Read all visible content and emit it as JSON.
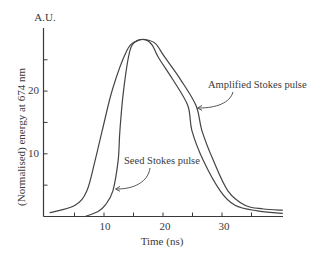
{
  "chart_data": {
    "type": "line",
    "title": "",
    "xlabel": "Time (ns)",
    "ylabel": "(Normalised) energy at 674 nm",
    "yunit_label": "A.U.",
    "xlim": [
      0,
      40
    ],
    "ylim": [
      0,
      30
    ],
    "x_ticks": [
      5,
      10,
      15,
      20,
      25,
      30,
      35
    ],
    "x_tick_labels": [
      {
        "value": 10,
        "label": "10"
      },
      {
        "value": 20,
        "label": "20"
      },
      {
        "value": 30,
        "label": "30"
      }
    ],
    "y_ticks": [
      5,
      10,
      15,
      20,
      25
    ],
    "y_tick_labels": [
      {
        "value": 10,
        "label": "10"
      },
      {
        "value": 20,
        "label": "20"
      }
    ],
    "grid": false,
    "legend": "none (inline annotations with arrows)",
    "series": [
      {
        "name": "Amplified Stokes pulse",
        "x": [
          0.8,
          5.1,
          7.1,
          8.5,
          9.7,
          11.5,
          13.9,
          15.5,
          17.0,
          18.7,
          20.3,
          23.0,
          25.6,
          26.6,
          28.5,
          31.0,
          33.9,
          37.0,
          40.3
        ],
        "y": [
          0.6,
          1.8,
          4.1,
          9.0,
          13.7,
          20.5,
          26.5,
          28.0,
          28.2,
          27.6,
          25.4,
          21.8,
          17.7,
          13.7,
          9.0,
          4.1,
          1.8,
          1.2,
          1.0
        ]
      },
      {
        "name": "Seed Stokes pulse",
        "x": [
          6.8,
          9.0,
          10.2,
          11.5,
          12.4,
          12.7,
          13.3,
          14.4,
          15.6,
          17.0,
          18.2,
          19.2,
          21.7,
          24.2,
          24.9,
          26.8,
          29.7,
          32.2,
          36.0,
          40.3
        ],
        "y": [
          0.0,
          0.8,
          1.8,
          4.1,
          9.0,
          13.7,
          20.0,
          26.5,
          28.0,
          28.2,
          27.3,
          25.4,
          21.8,
          17.7,
          13.7,
          9.0,
          4.1,
          1.8,
          0.9,
          0.5
        ]
      }
    ],
    "annotations": [
      {
        "text": "Amplified Stokes pulse",
        "points_to": "Amplified Stokes pulse",
        "at": {
          "x": 25.6,
          "y": 17.7
        }
      },
      {
        "text": "Seed Stokes pulse",
        "points_to": "Seed Stokes pulse",
        "at": {
          "x": 11.8,
          "y": 4.3
        }
      }
    ]
  },
  "labels": {
    "yunit": "A.U.",
    "ylabel": "(Normalised) energy at 674 nm",
    "xlabel": "Time (ns)",
    "x10": "10",
    "x20": "20",
    "x30": "30",
    "y10": "10",
    "y20": "20",
    "amplified": "Amplified Stokes pulse",
    "seed": "Seed Stokes pulse"
  },
  "colors": {
    "line": "#444444",
    "axis": "#3a3a3a",
    "background": "#ffffff"
  }
}
